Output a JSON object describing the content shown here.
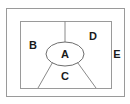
{
  "diagram": {
    "type": "euler-region-diagram",
    "background_color": "#ffffff",
    "outer_region": {
      "name": "outer-rectangle",
      "label": "E",
      "label_x": 117,
      "label_y": 55,
      "x": 6,
      "y": 8,
      "width": 118,
      "height": 88,
      "stroke_color": "#9a9a9a"
    },
    "inner_region": {
      "name": "inner-rectangle",
      "x": 20,
      "y": 21,
      "width": 91,
      "height": 67,
      "stroke_color": "#9a9a9a"
    },
    "ellipse_region": {
      "name": "center-ellipse",
      "label": "A",
      "label_x": 65,
      "label_y": 55,
      "cx": 65,
      "cy": 54,
      "rx": 19,
      "ry": 12,
      "stroke_color": "#6e6e6e"
    },
    "regions": [
      {
        "id": "A",
        "label": "A",
        "x": 65,
        "y": 55,
        "shape": "ellipse"
      },
      {
        "id": "B",
        "label": "B",
        "x": 33,
        "y": 46,
        "shape": "left-sector"
      },
      {
        "id": "C",
        "label": "C",
        "x": 65,
        "y": 77,
        "shape": "bottom-sector"
      },
      {
        "id": "D",
        "label": "D",
        "x": 93,
        "y": 37,
        "shape": "right-sector"
      },
      {
        "id": "E",
        "label": "E",
        "x": 117,
        "y": 55,
        "shape": "outer-margin"
      }
    ],
    "dividers": [
      {
        "id": "top-divider",
        "x1": 65,
        "y1": 21,
        "x2": 65,
        "y2": 42
      },
      {
        "id": "lower-left-divider",
        "x1": 52,
        "y1": 63,
        "x2": 38,
        "y2": 88
      },
      {
        "id": "lower-right-divider",
        "x1": 78,
        "y1": 63,
        "x2": 96,
        "y2": 88
      }
    ]
  }
}
